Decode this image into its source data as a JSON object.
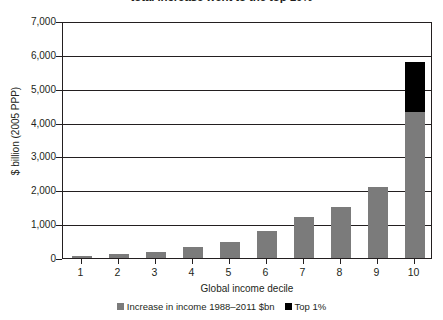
{
  "chart_data": {
    "type": "bar",
    "title": "total increase went to the top 10%",
    "xlabel": "Global income decile",
    "ylabel": "$ billion (2005 PPP)",
    "categories": [
      "1",
      "2",
      "3",
      "4",
      "5",
      "6",
      "7",
      "8",
      "9",
      "10"
    ],
    "series": [
      {
        "name": "Increase in income 1988–2011 $bn",
        "color": "#7b7b7b",
        "values": [
          60,
          110,
          180,
          320,
          480,
          800,
          1200,
          1500,
          2100,
          4300
        ]
      },
      {
        "name": "Top 1%",
        "color": "#000000",
        "values": [
          0,
          0,
          0,
          0,
          0,
          0,
          0,
          0,
          0,
          1500
        ]
      }
    ],
    "stacked": true,
    "ylim": [
      0,
      7000
    ],
    "ytick_labels": [
      "0",
      "1,000",
      "2,000",
      "3,000",
      "4,000",
      "5,000",
      "6,000",
      "7,000"
    ],
    "ytick_values": [
      0,
      1000,
      2000,
      3000,
      4000,
      5000,
      6000,
      7000
    ],
    "grid": true,
    "grid_axis": "y",
    "legend_position": "bottom"
  },
  "legend": {
    "entries": [
      {
        "label": "Increase in income 1988–2011 $bn",
        "color": "#7b7b7b"
      },
      {
        "label": "Top 1%",
        "color": "#000000"
      }
    ]
  }
}
